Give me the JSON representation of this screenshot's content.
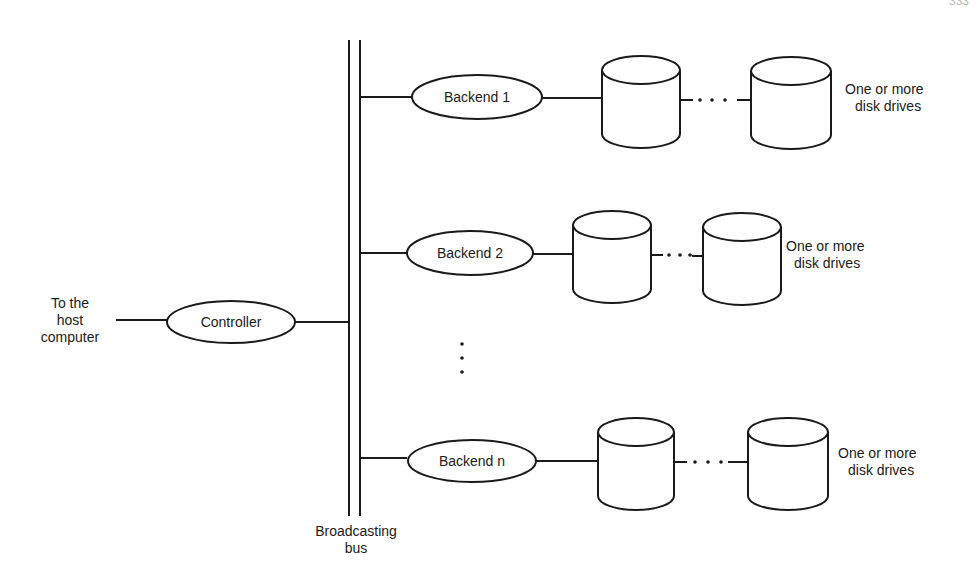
{
  "diagram": {
    "type": "block-diagram",
    "host_label_lines": [
      "To the",
      "host",
      "computer"
    ],
    "controller": {
      "label": "Controller"
    },
    "bus": {
      "label_lines": [
        "Broadcasting",
        "bus"
      ]
    },
    "backends": [
      {
        "label": "Backend 1",
        "drives_label_lines": [
          "One or more",
          "disk drives"
        ],
        "ellipsis": ". . ."
      },
      {
        "label": "Backend 2",
        "drives_label_lines": [
          "One or more",
          "disk drives"
        ],
        "ellipsis": ". . ."
      },
      {
        "label": "Backend n",
        "drives_label_lines": [
          "One or more",
          "disk drives"
        ],
        "ellipsis": ". . ."
      }
    ],
    "vertical_ellipsis": "⋮",
    "page_number_partial": "333",
    "colors": {
      "stroke": "#1a1a1a",
      "background": "#ffffff"
    }
  }
}
